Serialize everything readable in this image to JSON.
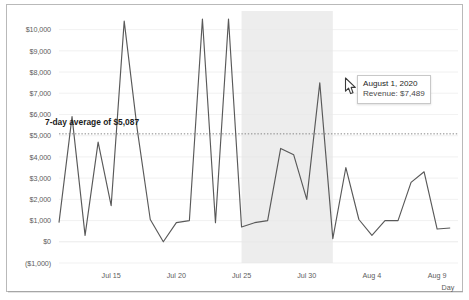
{
  "chart_data": {
    "type": "line",
    "title": "",
    "xlabel": "Day",
    "ylabel": "",
    "ylim": [
      -1000,
      10500
    ],
    "grid": true,
    "legend_position": "none",
    "ytick_labels": [
      "$10,000",
      "$9,000",
      "$8,000",
      "$7,000",
      "$6,000",
      "$5,000",
      "$4,000",
      "$3,000",
      "$2,000",
      "$1,000",
      "$0",
      "($1,000)"
    ],
    "ytick_values": [
      10000,
      9000,
      8000,
      7000,
      6000,
      5000,
      4000,
      3000,
      2000,
      1000,
      0,
      -1000
    ],
    "xtick_labels": [
      "Jul 15",
      "Jul 20",
      "Jul 25",
      "Jul 30",
      "Aug 4",
      "Aug 9"
    ],
    "xtick_days": [
      15,
      20,
      25,
      30,
      35,
      40
    ],
    "series": [
      {
        "name": "Revenue",
        "color": "#595959",
        "x": [
          11,
          12,
          13,
          14,
          15,
          16,
          17,
          18,
          19,
          20,
          21,
          22,
          23,
          24,
          25,
          26,
          27,
          28,
          29,
          30,
          31,
          32,
          33,
          34,
          35,
          36,
          37,
          38,
          39,
          40,
          41
        ],
        "values": [
          900,
          5900,
          300,
          4700,
          1700,
          10400,
          5300,
          1050,
          0,
          900,
          1000,
          10600,
          900,
          10600,
          700,
          900,
          1000,
          4400,
          4100,
          2000,
          7489,
          150,
          3500,
          1050,
          300,
          1000,
          1000,
          2800,
          3300,
          600,
          650
        ]
      }
    ],
    "average_line": {
      "label": "7-day average of $5,087",
      "value": 5087,
      "style": "dotted",
      "color": "#7a7a7a"
    },
    "shaded_region": {
      "start_day": 25,
      "end_day": 32,
      "color": "#ededed"
    },
    "annotations": [
      {
        "type": "tooltip",
        "at_day": 31,
        "title": "August 1, 2020",
        "rows": [
          {
            "label": "Revenue",
            "value": "$7,489"
          }
        ]
      }
    ]
  },
  "tooltip": {
    "title": "August 1, 2020",
    "row_label": "Revenue:",
    "row_value": "$7,489"
  },
  "axis": {
    "y_labels": [
      "$10,000",
      "$9,000",
      "$8,000",
      "$7,000",
      "$6,000",
      "$5,000",
      "$4,000",
      "$3,000",
      "$2,000",
      "$1,000",
      "$0",
      "($1,000)"
    ],
    "x_labels": [
      "Jul 15",
      "Jul 20",
      "Jul 25",
      "Jul 30",
      "Aug 4",
      "Aug 9"
    ],
    "x_title": "Day"
  },
  "average": {
    "label": "7-day average of $5,087"
  },
  "colors": {
    "line": "#595959",
    "shade": "#ededed",
    "grid": "#e8e8e8",
    "avg_line": "#7a7a7a",
    "frame": "#b9b9b9",
    "tick_text": "#5d5d5d"
  }
}
